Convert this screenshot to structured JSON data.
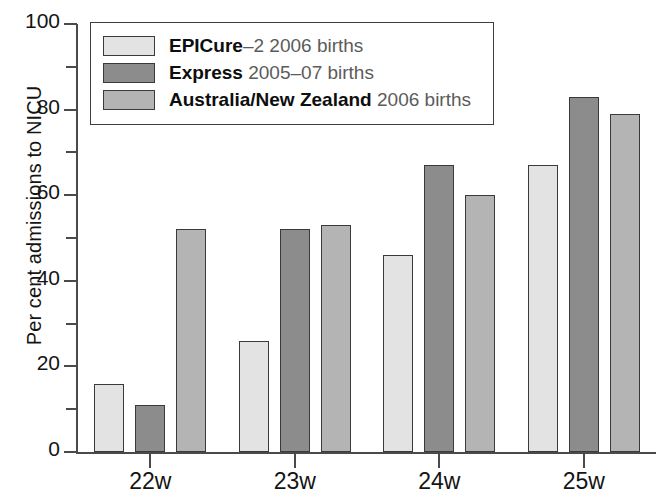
{
  "chart_data": {
    "type": "bar",
    "title": "",
    "xlabel": "",
    "ylabel": "Per cent admissions to NICU",
    "ylim": [
      0,
      100
    ],
    "ytick_labels": [
      "0",
      "20",
      "40",
      "60",
      "80",
      "100"
    ],
    "ytick_values": [
      0,
      20,
      40,
      60,
      80,
      100
    ],
    "yminor_values": [
      10,
      30,
      50,
      70,
      90
    ],
    "grid": false,
    "legend_position": "upper-left-inside",
    "categories": [
      "22w",
      "23w",
      "24w",
      "25w"
    ],
    "series": [
      {
        "name": "EPICure-2 2006 births",
        "name_bold": "EPICure",
        "name_rest": "–2 2006 births",
        "color": "#e3e3e3",
        "values": [
          16,
          26,
          46,
          67
        ]
      },
      {
        "name": "Express 2005–07 births",
        "name_bold": "Express",
        "name_rest": " 2005–07 births",
        "color": "#8c8c8c",
        "values": [
          11,
          52,
          67,
          83
        ]
      },
      {
        "name": "Australia/New Zealand 2006 births",
        "name_bold": "Australia/New Zealand",
        "name_rest": " 2006 births",
        "color": "#b4b4b4",
        "values": [
          52,
          53,
          60,
          79
        ]
      }
    ]
  },
  "axis": {
    "y_title": "Per cent admissions to NICU"
  },
  "legend": {
    "entries": [
      {
        "bold": "EPICure",
        "rest": "–2 2006 births"
      },
      {
        "bold": "Express",
        "rest": " 2005–07 births"
      },
      {
        "bold": "Australia/New Zealand",
        "rest": " 2006 births"
      }
    ]
  }
}
